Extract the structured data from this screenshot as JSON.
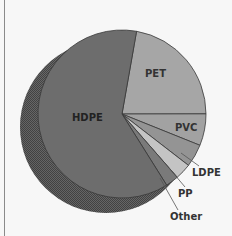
{
  "chart_data": {
    "type": "pie",
    "title": "",
    "style": "3d-offset-shadow",
    "categories": [
      "HDPE",
      "PET",
      "PVC",
      "LDPE",
      "PP",
      "Other"
    ],
    "values": [
      61.7,
      22.2,
      6.1,
      4.4,
      3.1,
      2.5
    ],
    "start_angle_deg": 10,
    "direction": "clockwise",
    "colors": [
      "#6d6d6d",
      "#a6a6a6",
      "#a2a2a2",
      "#949494",
      "#c4c4c4",
      "#7a7a7a"
    ],
    "labels": {
      "HDPE": {
        "text": "HDPE",
        "placement": "inside"
      },
      "PET": {
        "text": "PET",
        "placement": "inside"
      },
      "PVC": {
        "text": "PVC",
        "placement": "inside"
      },
      "LDPE": {
        "text": "LDPE",
        "placement": "outside-leader"
      },
      "PP": {
        "text": "PP",
        "placement": "outside-leader"
      },
      "Other": {
        "text": "Other",
        "placement": "outside-leader"
      }
    },
    "legend": "none",
    "grid": false
  }
}
